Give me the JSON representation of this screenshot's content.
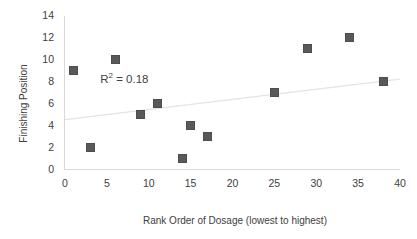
{
  "chart_data": {
    "type": "scatter",
    "title": "",
    "xlabel": "Rank Order of Dosage (lowest to highest)",
    "ylabel": "Finishing Position",
    "xlim": [
      0,
      40
    ],
    "ylim": [
      0,
      14
    ],
    "xticks": [
      "0",
      "5",
      "10",
      "15",
      "20",
      "25",
      "30",
      "35",
      "40"
    ],
    "yticks": [
      "0",
      "2",
      "4",
      "6",
      "8",
      "10",
      "12",
      "14"
    ],
    "xtick_values": [
      0,
      5,
      10,
      15,
      20,
      25,
      30,
      35,
      40
    ],
    "ytick_values": [
      0,
      2,
      4,
      6,
      8,
      10,
      12,
      14
    ],
    "grid": false,
    "legend": "none",
    "marker_color": "#595959",
    "marker_shape": "square",
    "text_color": "#404040",
    "trendline_color": "#e0e0e0",
    "x": [
      1,
      3,
      6,
      9,
      11,
      14,
      15,
      17,
      25,
      29,
      34,
      38
    ],
    "y": [
      9,
      2,
      10,
      5,
      6,
      1,
      4,
      3,
      7,
      11,
      12,
      8
    ],
    "points": [
      {
        "x": 1,
        "y": 9
      },
      {
        "x": 3,
        "y": 2
      },
      {
        "x": 6,
        "y": 10
      },
      {
        "x": 9,
        "y": 5
      },
      {
        "x": 11,
        "y": 6
      },
      {
        "x": 14,
        "y": 1
      },
      {
        "x": 15,
        "y": 4
      },
      {
        "x": 17,
        "y": 3
      },
      {
        "x": 25,
        "y": 7
      },
      {
        "x": 29,
        "y": 11
      },
      {
        "x": 34,
        "y": 12
      },
      {
        "x": 38,
        "y": 8
      }
    ],
    "trendline": {
      "type": "linear",
      "x_start": 0,
      "y_start": 4.55,
      "x_end": 40,
      "y_end": 8.25
    },
    "annotations": [
      {
        "name": "r2-annotation",
        "text": "R² = 0.18",
        "r2_value": 0.18,
        "x": 4.2,
        "y": 8.3
      }
    ]
  }
}
